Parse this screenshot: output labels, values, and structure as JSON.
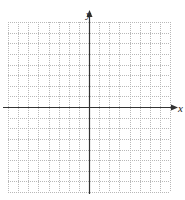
{
  "chart_data": {
    "type": "scatter",
    "title": "",
    "xlabel": "x",
    "ylabel": "y",
    "xlim": [
      -8,
      8
    ],
    "ylim": [
      -8,
      8
    ],
    "grid": true,
    "grid_style": "dotted",
    "series": []
  },
  "colors": {
    "axis": "#333333",
    "grid": "#b8b8b8"
  }
}
